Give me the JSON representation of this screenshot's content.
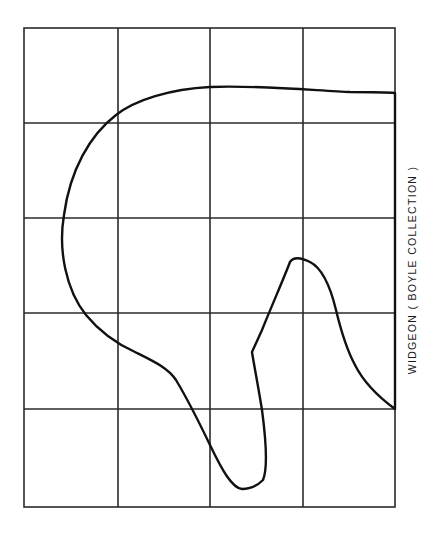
{
  "caption": "WIDGEON ( BOYLE COLLECTION )",
  "grid": {
    "left": 24,
    "right": 395,
    "top": 28,
    "bottom": 507,
    "columns": [
      24,
      118,
      210,
      303,
      395
    ],
    "rows": [
      28,
      123,
      218,
      313,
      409,
      507
    ],
    "line_color": "#2a2a2a"
  },
  "outline": {
    "description": "Hull lines / profile outline traced over a 4x5 grid",
    "stroke_color": "#111111",
    "path": "M395,409 L395,93 C385,92 370,92 350,92 C320,91 260,85 210,87 C170,89 135,100 116,115 C90,135 70,170 64,215 C58,250 66,290 86,315 C100,332 115,343 135,352 C155,362 168,368 176,380 C188,400 198,420 210,445 C222,470 232,488 242,489 C250,489 258,485 263,480 C268,468 266,440 262,410 C258,385 254,365 252,352 L262,330 C272,305 284,278 290,262 C294,256 302,258 310,262 C322,268 330,285 336,310 C342,335 348,352 355,365 C365,385 380,398 395,409 Z"
  }
}
